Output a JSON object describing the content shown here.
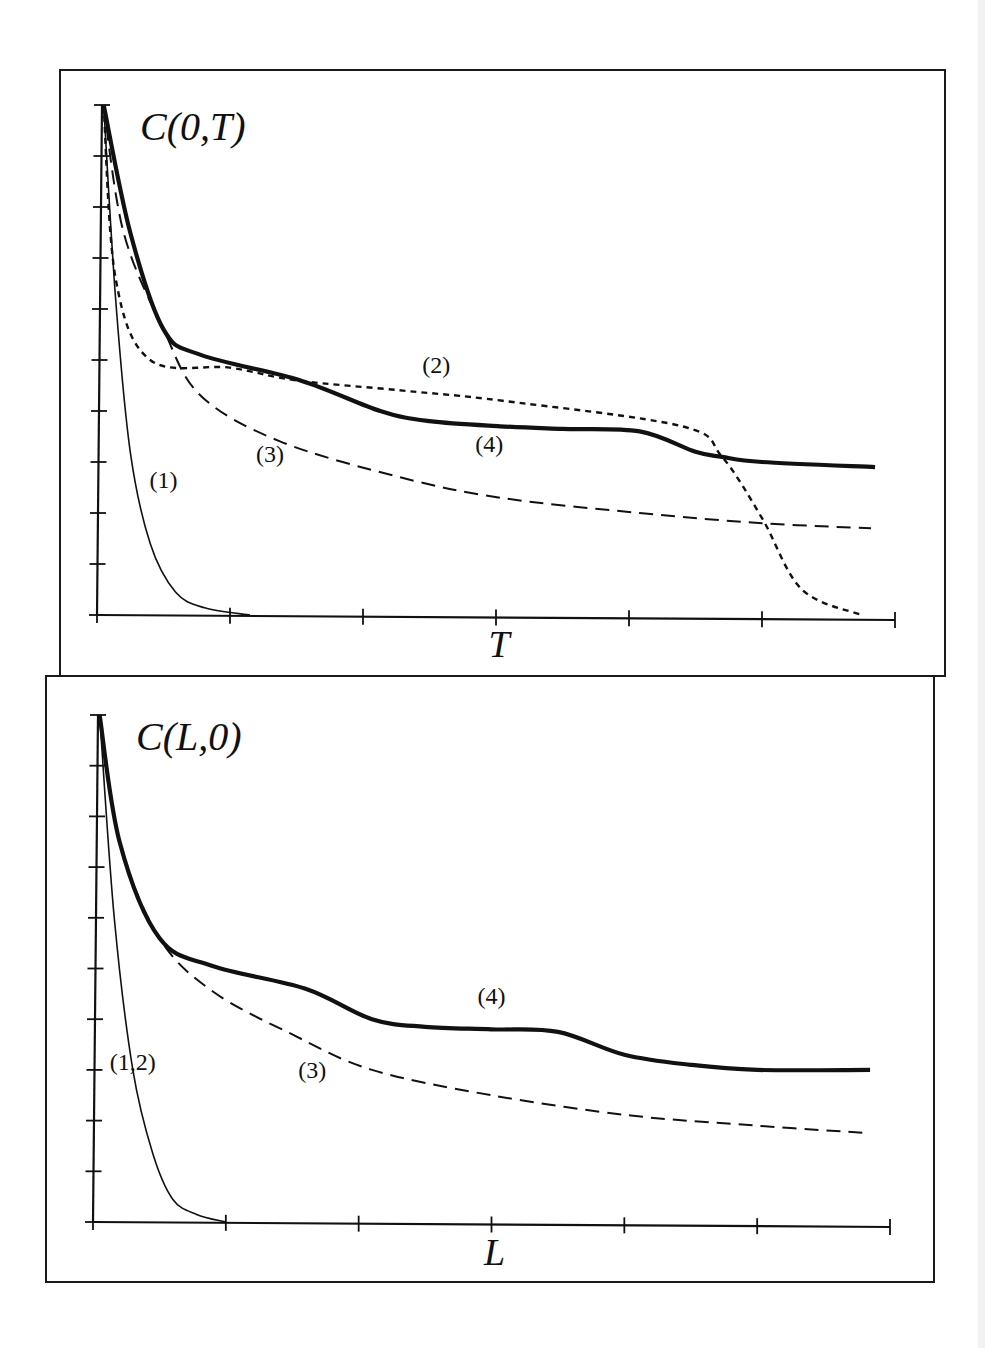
{
  "figure": {
    "top_caption_fragment": ""
  },
  "chart_data": [
    {
      "type": "line",
      "title": "C(0,T)",
      "xlabel": "T",
      "ylabel": "",
      "x_ticks": [
        0,
        1,
        2,
        3,
        4,
        5,
        6
      ],
      "x_tick_labels": [
        "",
        "",
        "",
        "",
        "",
        "",
        ""
      ],
      "y_ticks": [
        0,
        1,
        2,
        3,
        4,
        5,
        6,
        7,
        8,
        9,
        10
      ],
      "y_tick_labels": [
        "",
        "",
        "",
        "",
        "",
        "",
        "",
        "",
        "",
        "",
        ""
      ],
      "xlim": [
        0,
        6
      ],
      "ylim": [
        0,
        10
      ],
      "grid": false,
      "legend": "inline curve labels",
      "series": [
        {
          "name": "(1)",
          "style": "thin-solid",
          "label_pos": {
            "x": 0.5,
            "y": 2.5
          },
          "x": [
            0.05,
            0.14,
            0.25,
            0.4,
            0.59,
            0.81,
            1.15
          ],
          "y": [
            10,
            6.2,
            3.2,
            1.4,
            0.45,
            0.14,
            0
          ]
        },
        {
          "name": "(2)",
          "style": "short-dotted",
          "label_pos": {
            "x": 2.55,
            "y": 4.75
          },
          "x": [
            0.05,
            0.14,
            0.4,
            1.0,
            1.5,
            2.3,
            3.05,
            4.4,
            4.7,
            5.0,
            5.3,
            5.75
          ],
          "y": [
            10,
            6.6,
            5.0,
            4.85,
            4.6,
            4.4,
            4.2,
            3.7,
            3.1,
            1.9,
            0.5,
            0
          ]
        },
        {
          "name": "(3)",
          "style": "long-dashed",
          "label_pos": {
            "x": 1.3,
            "y": 3.0
          },
          "x": [
            0.05,
            0.2,
            0.5,
            0.78,
            1.38,
            2.28,
            3.03,
            4.08,
            5.0,
            5.82
          ],
          "y": [
            10,
            7.5,
            5.6,
            4.3,
            3.4,
            2.7,
            2.3,
            2.0,
            1.8,
            1.7
          ]
        },
        {
          "name": "(4)",
          "style": "thick-solid",
          "label_pos": {
            "x": 2.95,
            "y": 3.2
          },
          "x": [
            0.05,
            0.25,
            0.5,
            0.78,
            1.53,
            2.13,
            2.5,
            3.03,
            3.5,
            4.08,
            4.5,
            4.7,
            5.0,
            5.85
          ],
          "y": [
            10,
            7.5,
            5.6,
            5.1,
            4.6,
            4.0,
            3.8,
            3.7,
            3.65,
            3.6,
            3.2,
            3.1,
            3.0,
            2.9
          ]
        }
      ]
    },
    {
      "type": "line",
      "title": "C(L,0)",
      "xlabel": "L",
      "ylabel": "",
      "x_ticks": [
        0,
        1,
        2,
        3,
        4,
        5,
        6
      ],
      "x_tick_labels": [
        "",
        "",
        "",
        "",
        "",
        "",
        ""
      ],
      "y_ticks": [
        0,
        1,
        2,
        3,
        4,
        5,
        6,
        7,
        8,
        9,
        10
      ],
      "y_tick_labels": [
        "",
        "",
        "",
        "",
        "",
        "",
        "",
        "",
        "",
        "",
        ""
      ],
      "xlim": [
        0,
        6
      ],
      "ylim": [
        0,
        10
      ],
      "grid": false,
      "legend": "inline curve labels",
      "series": [
        {
          "name": "(1,2)",
          "style": "thin-solid",
          "label_pos": {
            "x": 0.3,
            "y": 3.0
          },
          "x": [
            0.05,
            0.16,
            0.3,
            0.45,
            0.6,
            0.78,
            1.0
          ],
          "y": [
            10,
            6.0,
            3.0,
            1.35,
            0.45,
            0.15,
            0
          ]
        },
        {
          "name": "(3)",
          "style": "long-dashed",
          "label_pos": {
            "x": 1.65,
            "y": 2.85
          },
          "x": [
            0.05,
            0.2,
            0.5,
            0.9,
            1.5,
            2.1,
            3.0,
            4.05,
            5.0,
            5.85
          ],
          "y": [
            10,
            7.5,
            5.6,
            4.55,
            3.7,
            3.0,
            2.5,
            2.1,
            1.9,
            1.75
          ]
        },
        {
          "name": "(4)",
          "style": "thick-solid",
          "label_pos": {
            "x": 3.0,
            "y": 4.3
          },
          "x": [
            0.05,
            0.2,
            0.5,
            0.9,
            1.6,
            2.1,
            2.5,
            3.0,
            3.5,
            4.0,
            4.5,
            5.0,
            5.85
          ],
          "y": [
            10,
            7.5,
            5.6,
            5.05,
            4.6,
            4.0,
            3.85,
            3.8,
            3.75,
            3.3,
            3.1,
            3.0,
            3.0
          ]
        }
      ]
    }
  ]
}
